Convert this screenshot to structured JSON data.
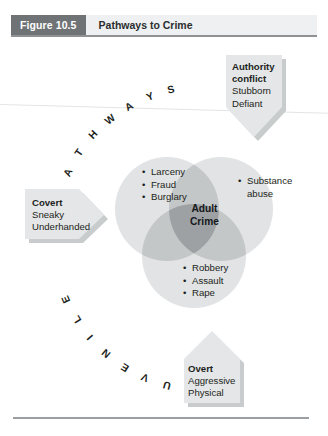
{
  "figure": {
    "number_label": "Figure 10.5",
    "title": "Pathways to Crime"
  },
  "arc_words": {
    "pathways": "PATHWAYS",
    "juvenile": "JUVENILE"
  },
  "venn": {
    "center_label_line1": "Adult",
    "center_label_line2": "Crime",
    "upper_left_items": [
      "Larceny",
      "Fraud",
      "Burglary"
    ],
    "upper_right_items": [
      "Substance",
      "abuse"
    ],
    "lower_items": [
      "Robbery",
      "Assault",
      "Rape"
    ],
    "bullet_glyph": "•"
  },
  "callouts": {
    "authority": {
      "title_line1": "Authority",
      "title_line2": "conflict",
      "body_line1": "Stubborn",
      "body_line2": "Defiant"
    },
    "covert": {
      "title": "Covert",
      "body_line1": "Sneaky",
      "body_line2": "Underhanded"
    },
    "overt": {
      "title": "Overt",
      "body_line1": "Aggressive",
      "body_line2": "Physical"
    }
  },
  "colors": {
    "figure_number_bg": "#6f7376",
    "header_bg": "#eef0f1",
    "header_rule": "#8e9295",
    "callout_fill": "#e3e5e6",
    "callout_shadow": "#c9cccd",
    "circle_fill": "#e0e2e3",
    "overlap_mid": "#c3c6c7",
    "overlap_center": "#9ea1a3",
    "text": "#1d1f21",
    "footer_rule": "#9b9fa2"
  }
}
